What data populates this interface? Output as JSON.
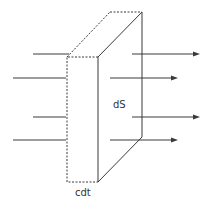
{
  "diagram": {
    "labels": {
      "surface": "dS",
      "thickness": "cdt"
    },
    "colors": {
      "stroke": "#3a3a3a",
      "background": "#ffffff"
    },
    "incoming_rays": 4,
    "outgoing_arrows": 4
  }
}
